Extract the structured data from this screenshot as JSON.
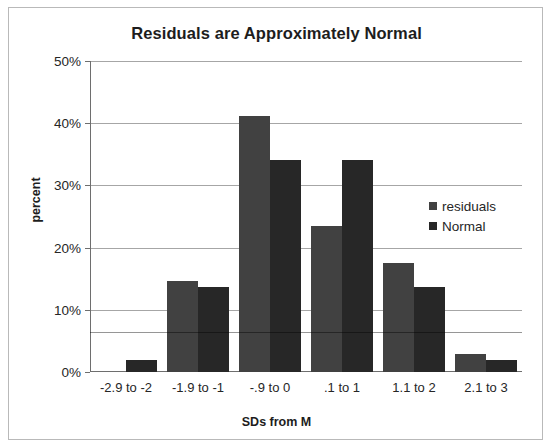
{
  "chart_data": {
    "type": "bar",
    "title": "Residuals are Approximately Normal",
    "xlabel": "SDs from M",
    "ylabel": "percent",
    "categories": [
      "-2.9 to -2",
      "-1.9 to -1",
      "-.9 to 0",
      ".1 to 1",
      "1.1 to 2",
      "2.1 to 3"
    ],
    "series": [
      {
        "name": "residuals",
        "color": "#414141",
        "values": [
          0,
          14.7,
          41.2,
          23.5,
          17.6,
          2.9
        ]
      },
      {
        "name": "Normal",
        "color": "#272727",
        "values": [
          2.0,
          13.6,
          34.1,
          34.1,
          13.6,
          2.0
        ]
      }
    ],
    "ylim": [
      0,
      50
    ],
    "ytick_labels": [
      "50%",
      "40%",
      "30%",
      "20%",
      "10%",
      "0%"
    ],
    "ytick_values": [
      50,
      40,
      30,
      20,
      10,
      0
    ],
    "ytick_step": 10,
    "grid": true,
    "legend_position": "middle-right",
    "value_unit": "percent"
  },
  "legend": {
    "items": [
      {
        "label": "residuals"
      },
      {
        "label": "Normal"
      }
    ]
  }
}
